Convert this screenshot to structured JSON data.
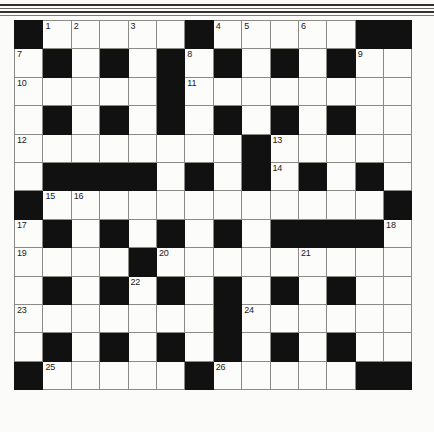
{
  "puzzle": {
    "title": "Crossword Grid",
    "columns": 14,
    "rows": 13,
    "cell_size_px": 28.4,
    "colors": {
      "block": "#111111",
      "cell": "#fcfcfa",
      "grid_line": "#8c8a85",
      "number_text": "#1a1a1a",
      "page": "#fbfbf9"
    },
    "legend": {
      "B": "blocked-cell",
      "W": "open-cell"
    },
    "clue_numbers_present": [
      1,
      2,
      3,
      4,
      5,
      6,
      7,
      8,
      9,
      10,
      11,
      12,
      13,
      14,
      15,
      16,
      17,
      18,
      19,
      20,
      21,
      22,
      23,
      24,
      25,
      26
    ],
    "grid": [
      [
        "B",
        "W",
        "W",
        "W",
        "W",
        "W",
        "B",
        "W",
        "W",
        "W",
        "W",
        "W",
        "B",
        "B"
      ],
      [
        "W",
        "B",
        "W",
        "B",
        "W",
        "B",
        "W",
        "B",
        "W",
        "B",
        "W",
        "B",
        "W",
        "W"
      ],
      [
        "W",
        "W",
        "W",
        "W",
        "W",
        "B",
        "W",
        "W",
        "W",
        "W",
        "W",
        "W",
        "W",
        "W"
      ],
      [
        "W",
        "B",
        "W",
        "B",
        "W",
        "B",
        "W",
        "B",
        "W",
        "B",
        "W",
        "B",
        "W",
        "W"
      ],
      [
        "W",
        "W",
        "W",
        "W",
        "W",
        "W",
        "W",
        "W",
        "B",
        "W",
        "W",
        "W",
        "W",
        "W"
      ],
      [
        "W",
        "B",
        "B",
        "B",
        "B",
        "W",
        "B",
        "W",
        "B",
        "W",
        "B",
        "W",
        "B",
        "W"
      ],
      [
        "B",
        "W",
        "W",
        "W",
        "W",
        "W",
        "W",
        "W",
        "W",
        "W",
        "W",
        "W",
        "W",
        "B"
      ],
      [
        "W",
        "B",
        "W",
        "B",
        "W",
        "B",
        "W",
        "B",
        "W",
        "B",
        "B",
        "B",
        "B",
        "W"
      ],
      [
        "W",
        "W",
        "W",
        "W",
        "B",
        "W",
        "W",
        "W",
        "W",
        "W",
        "W",
        "W",
        "W",
        "W"
      ],
      [
        "W",
        "B",
        "W",
        "B",
        "W",
        "B",
        "W",
        "B",
        "W",
        "B",
        "W",
        "B",
        "W",
        "W"
      ],
      [
        "W",
        "W",
        "W",
        "W",
        "W",
        "W",
        "W",
        "B",
        "W",
        "W",
        "W",
        "W",
        "W",
        "W"
      ],
      [
        "W",
        "B",
        "W",
        "B",
        "W",
        "B",
        "W",
        "B",
        "W",
        "B",
        "W",
        "B",
        "W",
        "W"
      ],
      [
        "B",
        "W",
        "W",
        "W",
        "W",
        "W",
        "B",
        "W",
        "W",
        "W",
        "W",
        "W",
        "B",
        "B"
      ]
    ],
    "numbers": [
      {
        "row": 0,
        "col": 1,
        "label": "1"
      },
      {
        "row": 0,
        "col": 2,
        "label": "2"
      },
      {
        "row": 0,
        "col": 4,
        "label": "3"
      },
      {
        "row": 0,
        "col": 7,
        "label": "4"
      },
      {
        "row": 0,
        "col": 8,
        "label": "5"
      },
      {
        "row": 0,
        "col": 10,
        "label": "6"
      },
      {
        "row": 1,
        "col": 0,
        "label": "7"
      },
      {
        "row": 1,
        "col": 6,
        "label": "8"
      },
      {
        "row": 1,
        "col": 12,
        "label": "9"
      },
      {
        "row": 2,
        "col": 0,
        "label": "10"
      },
      {
        "row": 2,
        "col": 6,
        "label": "11"
      },
      {
        "row": 4,
        "col": 0,
        "label": "12"
      },
      {
        "row": 4,
        "col": 9,
        "label": "13"
      },
      {
        "row": 5,
        "col": 9,
        "label": "14"
      },
      {
        "row": 6,
        "col": 1,
        "label": "15"
      },
      {
        "row": 6,
        "col": 2,
        "label": "16"
      },
      {
        "row": 7,
        "col": 0,
        "label": "17"
      },
      {
        "row": 7,
        "col": 13,
        "label": "18"
      },
      {
        "row": 8,
        "col": 0,
        "label": "19"
      },
      {
        "row": 8,
        "col": 5,
        "label": "20"
      },
      {
        "row": 8,
        "col": 10,
        "label": "21"
      },
      {
        "row": 9,
        "col": 4,
        "label": "22"
      },
      {
        "row": 10,
        "col": 0,
        "label": "23"
      },
      {
        "row": 10,
        "col": 8,
        "label": "24"
      },
      {
        "row": 12,
        "col": 1,
        "label": "25"
      },
      {
        "row": 12,
        "col": 7,
        "label": "26"
      }
    ]
  }
}
